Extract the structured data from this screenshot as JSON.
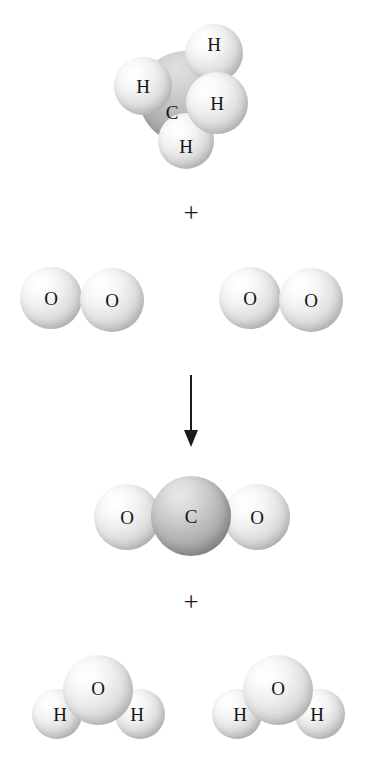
{
  "figure": {
    "width": 371,
    "height": 775,
    "background_color": "#ffffff",
    "caption": "",
    "reaction_name": "Combustion of methane",
    "equation_text": "CH4 + 2 O2 -> CO2 + 2 H2O"
  },
  "labels": {
    "hydrogen": "H",
    "carbon": "C",
    "oxygen": "O",
    "plus": "+"
  },
  "colors": {
    "background": "#ffffff",
    "atom_light": "#e6e6e6",
    "atom_dark": "#a8a8a8",
    "label_text": "#151515",
    "arrow": "#1b1b1b"
  },
  "operators": [
    {
      "id": "plus-reactants",
      "symbol": "+",
      "x": 176,
      "y": 200
    },
    {
      "id": "plus-products",
      "symbol": "+",
      "x": 176,
      "y": 589
    }
  ],
  "arrow": {
    "id": "reaction-arrow",
    "direction": "down",
    "x": 191,
    "y_start": 375,
    "y_end": 447,
    "color": "#1b1b1b"
  },
  "molecules": [
    {
      "id": "methane",
      "formula": "CH4",
      "role": "reactant",
      "name": "methane",
      "atoms": [
        {
          "element": "C",
          "label": "C",
          "cx": 185,
          "cy": 97,
          "r": 46,
          "shade": "dark-back",
          "z": 1,
          "label_dx": -13,
          "label_dy": 15
        },
        {
          "element": "H",
          "label": "H",
          "cx": 214,
          "cy": 53,
          "r": 29,
          "shade": "light",
          "z": 2,
          "label_dx": 0,
          "label_dy": -9
        },
        {
          "element": "H",
          "label": "H",
          "cx": 143,
          "cy": 86,
          "r": 29,
          "shade": "light",
          "z": 3,
          "label_dx": 0,
          "label_dy": 0
        },
        {
          "element": "H",
          "label": "H",
          "cx": 217,
          "cy": 103,
          "r": 31,
          "shade": "light",
          "z": 4,
          "label_dx": 0,
          "label_dy": 0
        },
        {
          "element": "H",
          "label": "H",
          "cx": 186,
          "cy": 141,
          "r": 28,
          "shade": "light",
          "z": 2,
          "label_dx": 0,
          "label_dy": 5
        }
      ]
    },
    {
      "id": "oxygen-1",
      "formula": "O2",
      "role": "reactant",
      "name": "oxygen molecule 1",
      "atoms": [
        {
          "element": "O",
          "label": "O",
          "cx": 51,
          "cy": 298,
          "r": 31,
          "shade": "light",
          "z": 1,
          "label_dx": 0,
          "label_dy": 0
        },
        {
          "element": "O",
          "label": "O",
          "cx": 112,
          "cy": 300,
          "r": 32,
          "shade": "light",
          "z": 2,
          "label_dx": 0,
          "label_dy": 0
        }
      ]
    },
    {
      "id": "oxygen-2",
      "formula": "O2",
      "role": "reactant",
      "name": "oxygen molecule 2",
      "atoms": [
        {
          "element": "O",
          "label": "O",
          "cx": 250,
          "cy": 298,
          "r": 31,
          "shade": "light",
          "z": 1,
          "label_dx": 0,
          "label_dy": 0
        },
        {
          "element": "O",
          "label": "O",
          "cx": 311,
          "cy": 300,
          "r": 32,
          "shade": "light",
          "z": 2,
          "label_dx": 0,
          "label_dy": 0
        }
      ]
    },
    {
      "id": "carbon-dioxide",
      "formula": "CO2",
      "role": "product",
      "name": "carbon dioxide",
      "atoms": [
        {
          "element": "O",
          "label": "O",
          "cx": 127,
          "cy": 517,
          "r": 33,
          "shade": "light",
          "z": 1,
          "label_dx": 0,
          "label_dy": 0
        },
        {
          "element": "O",
          "label": "O",
          "cx": 257,
          "cy": 517,
          "r": 33,
          "shade": "light",
          "z": 1,
          "label_dx": 0,
          "label_dy": 0
        },
        {
          "element": "C",
          "label": "C",
          "cx": 191,
          "cy": 516,
          "r": 40,
          "shade": "dark",
          "z": 2,
          "label_dx": 0,
          "label_dy": 0
        }
      ]
    },
    {
      "id": "water-1",
      "formula": "H2O",
      "role": "product",
      "name": "water molecule 1",
      "atoms": [
        {
          "element": "H",
          "label": "H",
          "cx": 57,
          "cy": 714,
          "r": 25,
          "shade": "light",
          "z": 1,
          "label_dx": 3,
          "label_dy": 0
        },
        {
          "element": "H",
          "label": "H",
          "cx": 140,
          "cy": 714,
          "r": 25,
          "shade": "light",
          "z": 1,
          "label_dx": -3,
          "label_dy": 0
        },
        {
          "element": "O",
          "label": "O",
          "cx": 98,
          "cy": 690,
          "r": 35,
          "shade": "light",
          "z": 2,
          "label_dx": 0,
          "label_dy": -2
        }
      ]
    },
    {
      "id": "water-2",
      "formula": "H2O",
      "role": "product",
      "name": "water molecule 2",
      "atoms": [
        {
          "element": "H",
          "label": "H",
          "cx": 237,
          "cy": 714,
          "r": 25,
          "shade": "light",
          "z": 1,
          "label_dx": 3,
          "label_dy": 0
        },
        {
          "element": "H",
          "label": "H",
          "cx": 320,
          "cy": 714,
          "r": 25,
          "shade": "light",
          "z": 1,
          "label_dx": -3,
          "label_dy": 0
        },
        {
          "element": "O",
          "label": "O",
          "cx": 278,
          "cy": 690,
          "r": 35,
          "shade": "light",
          "z": 2,
          "label_dx": 0,
          "label_dy": -2
        }
      ]
    }
  ]
}
